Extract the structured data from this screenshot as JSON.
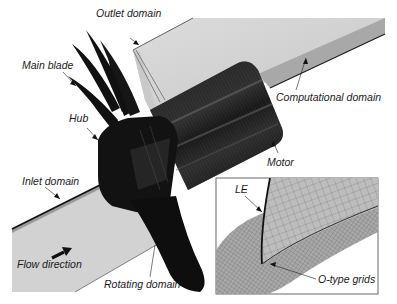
{
  "figure": {
    "labels": {
      "outlet_domain": "Outlet domain",
      "main_blade": "Main blade",
      "hub": "Hub",
      "computational_domain": "Computational domain",
      "motor": "Motor",
      "inlet_domain": "Inlet domain",
      "flow_direction": "Flow direction",
      "rotating_domain": "Rotating domain",
      "le": "LE",
      "o_type_grids": "O-type grids"
    },
    "colors": {
      "background": "#ffffff",
      "domain_face_light": "#d6d6d6",
      "domain_face_mid": "#b5b5b5",
      "domain_face_dark": "#8f8f8f",
      "mesh_dark": "#1c1c1c",
      "mesh_line": "#4a4a4a",
      "text": "#1a1a1a"
    }
  }
}
